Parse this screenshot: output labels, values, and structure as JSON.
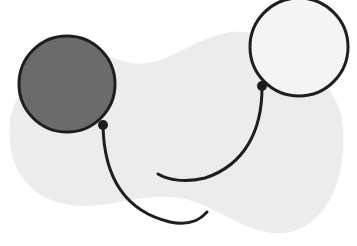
{
  "scene": {
    "description": "Two balloons with strings over a light gray blob",
    "colors": {
      "background": "#ffffff",
      "blob": "#ececec",
      "outline": "#1e1e1e",
      "dark_balloon_fill": "#6b6b6b",
      "light_balloon_fill": "#f4f4f4"
    },
    "balloons": [
      {
        "name": "dark-balloon",
        "cx": 67,
        "cy": 84,
        "r": 48,
        "fill": "#6b6b6b"
      },
      {
        "name": "light-balloon",
        "cx": 299,
        "cy": 47,
        "r": 49,
        "fill": "#f4f4f4"
      }
    ]
  }
}
